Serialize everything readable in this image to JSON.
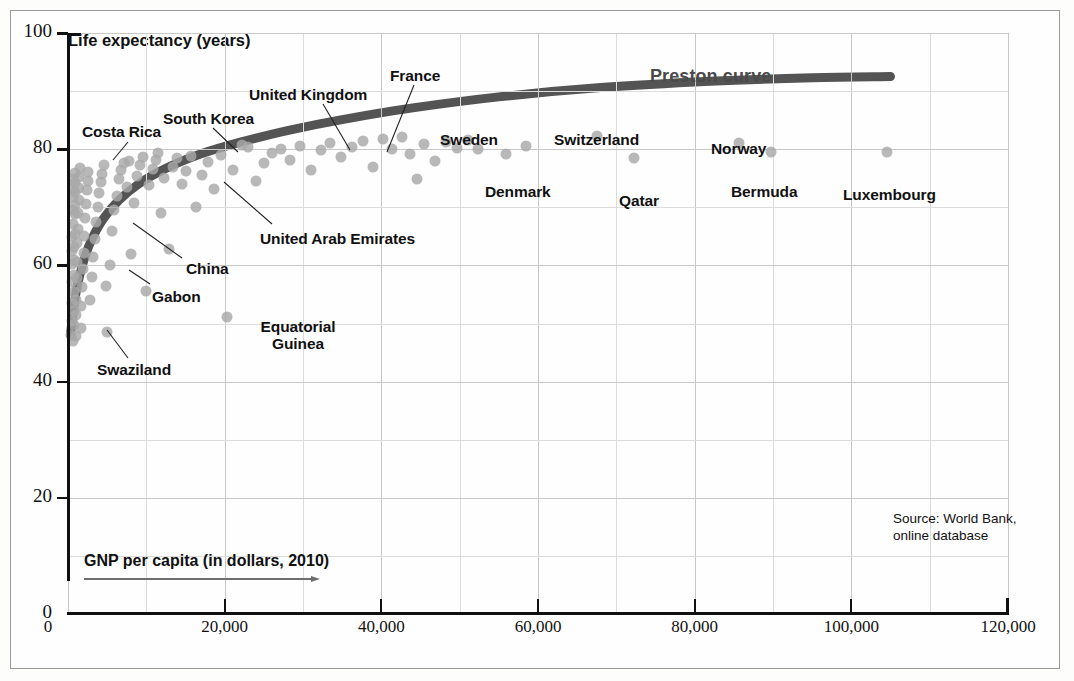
{
  "chart_data": {
    "type": "scatter",
    "title": "",
    "curve_label": "Preston curve",
    "xlabel": "GNP per capita (in dollars, 2010)",
    "ylabel": "Life expectancy (years)",
    "xlim": [
      0,
      120000
    ],
    "ylim": [
      0,
      100
    ],
    "xticks": [
      0,
      20000,
      40000,
      60000,
      80000,
      100000,
      120000
    ],
    "xtick_labels": [
      "0",
      "20,000",
      "40,000",
      "60,000",
      "80,000",
      "100,000",
      "120,000"
    ],
    "yticks": [
      0,
      20,
      40,
      60,
      80,
      100
    ],
    "ytick_labels": [
      "0",
      "20",
      "40",
      "60",
      "80",
      "100"
    ],
    "x_minor_step": 10000,
    "y_minor_step": 10,
    "grid": true,
    "legend_position": "none",
    "source": "Source: World Bank,\nonline database",
    "source_lines": [
      "Source: World Bank,",
      "online database"
    ],
    "point_color": "#a8a8a8",
    "curve_color": "#545454",
    "grid_color": "#c8c8c8",
    "axis_color": "#111111",
    "labeled_points": [
      {
        "name": "Costa Rica",
        "x": 11500,
        "y": 79.3
      },
      {
        "name": "South Korea",
        "x": 22200,
        "y": 80.8
      },
      {
        "name": "United Kingdom",
        "x": 36300,
        "y": 80.4
      },
      {
        "name": "France",
        "x": 40200,
        "y": 81.7
      },
      {
        "name": "Sweden",
        "x": 51000,
        "y": 81.5
      },
      {
        "name": "Switzerland",
        "x": 67500,
        "y": 82.2
      },
      {
        "name": "Norway",
        "x": 85600,
        "y": 81.0
      },
      {
        "name": "Bermuda",
        "x": 89800,
        "y": 79.5
      },
      {
        "name": "Luxembourg",
        "x": 104600,
        "y": 79.6
      },
      {
        "name": "Denmark",
        "x": 55900,
        "y": 79.1
      },
      {
        "name": "Qatar",
        "x": 72300,
        "y": 78.4
      },
      {
        "name": "United Arab Emirates",
        "x": 31000,
        "y": 76.5
      },
      {
        "name": "China",
        "x": 7500,
        "y": 73.5
      },
      {
        "name": "Gabon",
        "x": 12900,
        "y": 62.8
      },
      {
        "name": "Swaziland",
        "x": 5000,
        "y": 48.5
      },
      {
        "name": "Equatorial Guinea",
        "x": 20300,
        "y": 51.1
      }
    ],
    "curve_points": [
      {
        "x": 300,
        "y": 48.0
      },
      {
        "x": 700,
        "y": 52.5
      },
      {
        "x": 1200,
        "y": 56.6
      },
      {
        "x": 2000,
        "y": 60.8
      },
      {
        "x": 3000,
        "y": 64.4
      },
      {
        "x": 4500,
        "y": 68.0
      },
      {
        "x": 6500,
        "y": 71.2
      },
      {
        "x": 9000,
        "y": 74.0
      },
      {
        "x": 12500,
        "y": 76.7
      },
      {
        "x": 17000,
        "y": 79.2
      },
      {
        "x": 22000,
        "y": 81.2
      },
      {
        "x": 28000,
        "y": 83.2
      },
      {
        "x": 35000,
        "y": 85.1
      },
      {
        "x": 44000,
        "y": 87.1
      },
      {
        "x": 55000,
        "y": 89.0
      },
      {
        "x": 68000,
        "y": 90.6
      },
      {
        "x": 82000,
        "y": 91.7
      },
      {
        "x": 95000,
        "y": 92.3
      },
      {
        "x": 105000,
        "y": 92.5
      }
    ],
    "points": [
      {
        "x": 420,
        "y": 48.1
      },
      {
        "x": 450,
        "y": 50.4
      },
      {
        "x": 480,
        "y": 53.6
      },
      {
        "x": 500,
        "y": 57.1
      },
      {
        "x": 520,
        "y": 60.2
      },
      {
        "x": 540,
        "y": 62.4
      },
      {
        "x": 560,
        "y": 64.9
      },
      {
        "x": 580,
        "y": 67.1
      },
      {
        "x": 600,
        "y": 69.6
      },
      {
        "x": 620,
        "y": 71.8
      },
      {
        "x": 640,
        "y": 73.1
      },
      {
        "x": 660,
        "y": 74.9
      },
      {
        "x": 700,
        "y": 47.0
      },
      {
        "x": 720,
        "y": 49.8
      },
      {
        "x": 740,
        "y": 52.2
      },
      {
        "x": 760,
        "y": 55.5
      },
      {
        "x": 780,
        "y": 58.3
      },
      {
        "x": 800,
        "y": 61.0
      },
      {
        "x": 820,
        "y": 63.2
      },
      {
        "x": 840,
        "y": 65.4
      },
      {
        "x": 860,
        "y": 68.8
      },
      {
        "x": 880,
        "y": 70.4
      },
      {
        "x": 900,
        "y": 72.6
      },
      {
        "x": 930,
        "y": 74.2
      },
      {
        "x": 950,
        "y": 75.9
      },
      {
        "x": 980,
        "y": 47.8
      },
      {
        "x": 1000,
        "y": 51.5
      },
      {
        "x": 1050,
        "y": 54.1
      },
      {
        "x": 1100,
        "y": 57.8
      },
      {
        "x": 1150,
        "y": 60.5
      },
      {
        "x": 1200,
        "y": 63.8
      },
      {
        "x": 1250,
        "y": 66.2
      },
      {
        "x": 1300,
        "y": 69.1
      },
      {
        "x": 1350,
        "y": 71.3
      },
      {
        "x": 1400,
        "y": 73.4
      },
      {
        "x": 1450,
        "y": 75.2
      },
      {
        "x": 1500,
        "y": 76.8
      },
      {
        "x": 1600,
        "y": 49.2
      },
      {
        "x": 1700,
        "y": 53.0
      },
      {
        "x": 1800,
        "y": 56.2
      },
      {
        "x": 1900,
        "y": 59.4
      },
      {
        "x": 2000,
        "y": 62.1
      },
      {
        "x": 2100,
        "y": 65.0
      },
      {
        "x": 2200,
        "y": 68.1
      },
      {
        "x": 2300,
        "y": 70.6
      },
      {
        "x": 2400,
        "y": 72.9
      },
      {
        "x": 2500,
        "y": 74.6
      },
      {
        "x": 2600,
        "y": 76.1
      },
      {
        "x": 2800,
        "y": 54.0
      },
      {
        "x": 3000,
        "y": 58.0
      },
      {
        "x": 3200,
        "y": 61.5
      },
      {
        "x": 3400,
        "y": 64.5
      },
      {
        "x": 3600,
        "y": 67.5
      },
      {
        "x": 3800,
        "y": 70.0
      },
      {
        "x": 4000,
        "y": 72.4
      },
      {
        "x": 4200,
        "y": 74.3
      },
      {
        "x": 4400,
        "y": 75.8
      },
      {
        "x": 4600,
        "y": 77.2
      },
      {
        "x": 4800,
        "y": 56.5
      },
      {
        "x": 5000,
        "y": 48.5
      },
      {
        "x": 5300,
        "y": 60.0
      },
      {
        "x": 5600,
        "y": 66.0
      },
      {
        "x": 5900,
        "y": 69.5
      },
      {
        "x": 6200,
        "y": 72.0
      },
      {
        "x": 6500,
        "y": 74.8
      },
      {
        "x": 6800,
        "y": 76.4
      },
      {
        "x": 7100,
        "y": 77.6
      },
      {
        "x": 7500,
        "y": 73.5
      },
      {
        "x": 7800,
        "y": 78.0
      },
      {
        "x": 8100,
        "y": 62.0
      },
      {
        "x": 8400,
        "y": 70.8
      },
      {
        "x": 8800,
        "y": 75.4
      },
      {
        "x": 9200,
        "y": 77.3
      },
      {
        "x": 9600,
        "y": 78.6
      },
      {
        "x": 10000,
        "y": 55.6
      },
      {
        "x": 10400,
        "y": 73.9
      },
      {
        "x": 10800,
        "y": 76.6
      },
      {
        "x": 11200,
        "y": 78.2
      },
      {
        "x": 11500,
        "y": 79.3
      },
      {
        "x": 11900,
        "y": 69.0
      },
      {
        "x": 12300,
        "y": 75.1
      },
      {
        "x": 12900,
        "y": 62.8
      },
      {
        "x": 13400,
        "y": 77.0
      },
      {
        "x": 13900,
        "y": 78.4
      },
      {
        "x": 14500,
        "y": 74.0
      },
      {
        "x": 15100,
        "y": 76.3
      },
      {
        "x": 15700,
        "y": 78.9
      },
      {
        "x": 16400,
        "y": 70.0
      },
      {
        "x": 17100,
        "y": 75.5
      },
      {
        "x": 17900,
        "y": 77.8
      },
      {
        "x": 18700,
        "y": 73.2
      },
      {
        "x": 19500,
        "y": 79.0
      },
      {
        "x": 20300,
        "y": 51.1
      },
      {
        "x": 21100,
        "y": 76.5
      },
      {
        "x": 22200,
        "y": 80.8
      },
      {
        "x": 23000,
        "y": 80.3
      },
      {
        "x": 24000,
        "y": 74.5
      },
      {
        "x": 25000,
        "y": 77.6
      },
      {
        "x": 26000,
        "y": 79.4
      },
      {
        "x": 27200,
        "y": 80.0
      },
      {
        "x": 28400,
        "y": 78.1
      },
      {
        "x": 29600,
        "y": 80.6
      },
      {
        "x": 31000,
        "y": 76.5
      },
      {
        "x": 32300,
        "y": 79.8
      },
      {
        "x": 33500,
        "y": 81.0
      },
      {
        "x": 34800,
        "y": 78.6
      },
      {
        "x": 36300,
        "y": 80.4
      },
      {
        "x": 37700,
        "y": 81.4
      },
      {
        "x": 38900,
        "y": 77.0
      },
      {
        "x": 40200,
        "y": 81.7
      },
      {
        "x": 41400,
        "y": 80.0
      },
      {
        "x": 42600,
        "y": 82.1
      },
      {
        "x": 43600,
        "y": 79.2
      },
      {
        "x": 44600,
        "y": 74.9
      },
      {
        "x": 45500,
        "y": 80.9
      },
      {
        "x": 46800,
        "y": 78.0
      },
      {
        "x": 48200,
        "y": 81.2
      },
      {
        "x": 49600,
        "y": 80.2
      },
      {
        "x": 51000,
        "y": 81.5
      },
      {
        "x": 52300,
        "y": 80.1
      },
      {
        "x": 55900,
        "y": 79.1
      },
      {
        "x": 58500,
        "y": 80.5
      },
      {
        "x": 67500,
        "y": 82.2
      },
      {
        "x": 72300,
        "y": 78.4
      },
      {
        "x": 85600,
        "y": 81.0
      },
      {
        "x": 89800,
        "y": 79.5
      },
      {
        "x": 104600,
        "y": 79.6
      }
    ]
  }
}
